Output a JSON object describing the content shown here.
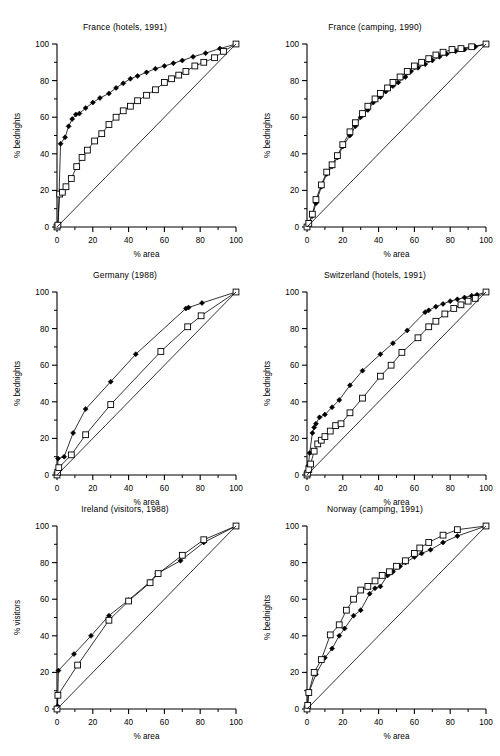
{
  "figure": {
    "columns": 2,
    "rows": 3,
    "background": "#ffffff",
    "line_color": "#000000"
  },
  "axis_common": {
    "xlabel": "% area",
    "ylabel_bednights": "% bednights",
    "ylabel_visitors": "% visitors",
    "xlim": [
      0,
      100
    ],
    "ylim": [
      0,
      100
    ],
    "xticks": [
      0,
      20,
      40,
      60,
      80,
      100
    ],
    "yticks": [
      0,
      20,
      40,
      60,
      80,
      100
    ],
    "xtick_labels": [
      "0",
      "20",
      "40",
      "60",
      "80",
      "100"
    ],
    "ytick_labels": [
      "0",
      "20",
      "40",
      "60",
      "80",
      "100"
    ],
    "minor_xticks": [
      10,
      30,
      50,
      70,
      90
    ],
    "minor_yticks": [
      10,
      30,
      50,
      70,
      90
    ],
    "grid": false,
    "legend": "none",
    "series_names": [
      "filled-diamond-series",
      "open-square-series",
      "equality-line"
    ],
    "marker_filled": "filled diamond",
    "marker_open": "open square"
  },
  "chart_data": [
    {
      "type": "line",
      "panel": "france-hotels",
      "title": "France (hotels, 1991)",
      "xlabel": "% area",
      "ylabel": "% bednights",
      "xlim": [
        0,
        100
      ],
      "ylim": [
        0,
        100
      ],
      "grid": false,
      "series": [
        {
          "name": "filled-diamond-series",
          "marker": "filled-diamond",
          "x": [
            0,
            0.6,
            2,
            4.5,
            6.5,
            8.5,
            10.5,
            12.5,
            16,
            20,
            24,
            29,
            33,
            37,
            41,
            45,
            50,
            55,
            60,
            65,
            70,
            76,
            83,
            91,
            100
          ],
          "y": [
            0,
            1,
            45.5,
            49,
            55,
            59,
            61.5,
            62,
            65,
            68,
            70.5,
            73,
            76,
            78.5,
            81,
            82.5,
            84.5,
            86.5,
            88,
            89.5,
            91,
            93,
            95,
            97.5,
            100
          ]
        },
        {
          "name": "open-square-series",
          "marker": "open-square",
          "x": [
            0,
            0.5,
            1.5,
            3,
            5,
            8,
            11,
            14,
            17,
            21,
            25,
            29,
            33,
            37,
            41,
            45,
            50,
            55,
            60,
            64,
            68,
            72,
            77,
            82,
            88,
            93,
            100
          ],
          "y": [
            0,
            1,
            18,
            19,
            22,
            26.5,
            33,
            38,
            42,
            47,
            51,
            56,
            60,
            63.5,
            66,
            69,
            72,
            75,
            79,
            81,
            83,
            85,
            88,
            90,
            92.5,
            96,
            100
          ]
        },
        {
          "name": "equality-line",
          "marker": "none",
          "x": [
            0,
            100
          ],
          "y": [
            0,
            100
          ]
        }
      ]
    },
    {
      "type": "line",
      "panel": "france-camping",
      "title": "France (camping, 1990)",
      "xlabel": "% area",
      "ylabel": "% bednights",
      "xlim": [
        0,
        100
      ],
      "ylim": [
        0,
        100
      ],
      "grid": false,
      "series": [
        {
          "name": "filled-diamond-series",
          "marker": "filled-diamond",
          "x": [
            0,
            1,
            3,
            5,
            8,
            11,
            14,
            17,
            20,
            24,
            27,
            30,
            34,
            37,
            41,
            44,
            48,
            51,
            55,
            58,
            62,
            66,
            70,
            74,
            78,
            83,
            88,
            94,
            100
          ],
          "y": [
            0,
            2,
            6,
            13,
            22,
            29,
            33,
            38,
            44,
            50,
            55,
            60,
            64,
            68,
            71,
            74,
            77,
            79,
            82,
            85,
            87,
            89,
            91,
            93,
            94.5,
            96,
            97,
            98.5,
            100
          ]
        },
        {
          "name": "open-square-series",
          "marker": "open-square",
          "x": [
            0,
            1,
            3,
            5,
            8,
            11,
            14,
            17,
            20,
            24,
            27,
            31,
            34,
            38,
            41,
            45,
            48,
            52,
            56,
            60,
            64,
            68,
            72,
            76,
            81,
            86,
            92,
            100
          ],
          "y": [
            0,
            2,
            7,
            15,
            23,
            30,
            34,
            39,
            45,
            52,
            57,
            62,
            66,
            70,
            73,
            76,
            79,
            82,
            85,
            88,
            90,
            92,
            94,
            95.5,
            97,
            97.5,
            98.5,
            100
          ]
        },
        {
          "name": "equality-line",
          "marker": "none",
          "x": [
            0,
            100
          ],
          "y": [
            0,
            100
          ]
        }
      ]
    },
    {
      "type": "line",
      "panel": "germany",
      "title": "Germany (1988)",
      "xlabel": "% area",
      "ylabel": "% bednights",
      "xlim": [
        0,
        100
      ],
      "ylim": [
        0,
        100
      ],
      "grid": false,
      "series": [
        {
          "name": "filled-diamond-series",
          "marker": "filled-diamond",
          "x": [
            0,
            0.3,
            0.6,
            4,
            9,
            16,
            30,
            44,
            72,
            73.5,
            81,
            100
          ],
          "y": [
            0,
            2,
            9,
            10,
            23,
            36,
            51,
            66,
            91,
            91.5,
            94,
            100
          ]
        },
        {
          "name": "open-square-series",
          "marker": "open-square",
          "x": [
            0,
            0.4,
            1,
            8,
            16,
            30,
            58,
            73,
            80.5,
            100
          ],
          "y": [
            0,
            1.5,
            4,
            11,
            22,
            38.5,
            67.5,
            81,
            87,
            100
          ]
        },
        {
          "name": "equality-line",
          "marker": "none",
          "x": [
            0,
            100
          ],
          "y": [
            0,
            100
          ]
        }
      ]
    },
    {
      "type": "line",
      "panel": "switzerland-hotels",
      "title": "Switzerland (hotels, 1991)",
      "xlabel": "% area",
      "ylabel": "% bednights",
      "xlim": [
        0,
        100
      ],
      "ylim": [
        0,
        100
      ],
      "grid": false,
      "series": [
        {
          "name": "filled-diamond-series",
          "marker": "filled-diamond",
          "x": [
            0,
            0.3,
            0.7,
            1.5,
            3,
            4,
            5,
            7,
            10,
            14,
            18,
            24,
            31,
            41,
            48,
            56,
            66,
            68,
            72,
            76,
            80,
            84,
            88,
            92,
            95,
            100
          ],
          "y": [
            0,
            2,
            5,
            12,
            23,
            26,
            28,
            31.5,
            33,
            37,
            41,
            49,
            57,
            66,
            72,
            79,
            89,
            90,
            92,
            93.5,
            95,
            96,
            97,
            98,
            98.5,
            100
          ]
        },
        {
          "name": "open-square-series",
          "marker": "open-square",
          "x": [
            0,
            0.4,
            1,
            2,
            4,
            6,
            8,
            10,
            13,
            16,
            19,
            24,
            31,
            41,
            47,
            53,
            62,
            68,
            72,
            77,
            82,
            86,
            90,
            94,
            100
          ],
          "y": [
            0,
            1,
            3,
            6,
            13,
            17,
            19,
            21,
            24,
            27,
            28,
            34,
            42,
            54,
            60,
            67,
            75,
            81,
            84,
            88,
            91,
            93,
            95,
            96.5,
            100
          ]
        },
        {
          "name": "equality-line",
          "marker": "none",
          "x": [
            0,
            100
          ],
          "y": [
            0,
            100
          ]
        }
      ]
    },
    {
      "type": "line",
      "panel": "ireland-visitors",
      "title": "Ireland (visitors, 1988)",
      "xlabel": "% area",
      "ylabel": "% visitors",
      "xlim": [
        0,
        100
      ],
      "ylim": [
        0,
        100
      ],
      "grid": false,
      "series": [
        {
          "name": "filled-diamond-series",
          "marker": "filled-diamond",
          "x": [
            0,
            0.3,
            0.8,
            9.5,
            19,
            29,
            40,
            52,
            56,
            69,
            82,
            100
          ],
          "y": [
            0,
            1.5,
            21,
            30,
            40,
            51,
            59.5,
            69.5,
            74,
            81,
            91,
            100
          ]
        },
        {
          "name": "open-square-series",
          "marker": "open-square",
          "x": [
            0,
            0.5,
            11.5,
            29,
            40,
            52,
            56.5,
            70,
            82,
            100
          ],
          "y": [
            0,
            7.5,
            24,
            48.5,
            59,
            69,
            74,
            84,
            92.5,
            100
          ]
        },
        {
          "name": "equality-line",
          "marker": "none",
          "x": [
            0,
            100
          ],
          "y": [
            0,
            100
          ]
        }
      ]
    },
    {
      "type": "line",
      "panel": "norway-camping",
      "title": "Norway (camping, 1991)",
      "xlabel": "% area",
      "ylabel": "% bednights",
      "xlim": [
        0,
        100
      ],
      "ylim": [
        0,
        100
      ],
      "grid": false,
      "series": [
        {
          "name": "filled-diamond-series",
          "marker": "filled-diamond",
          "x": [
            0,
            0.3,
            0.8,
            5,
            10,
            14,
            18,
            21,
            26,
            30,
            35,
            38,
            41,
            45,
            48,
            52,
            55,
            60,
            64,
            69,
            76,
            84,
            100
          ],
          "y": [
            0,
            2,
            8.5,
            19,
            28,
            33,
            40,
            44,
            51,
            54,
            63,
            66,
            67,
            73,
            75,
            78,
            80,
            83,
            85,
            87,
            91,
            94.5,
            100
          ]
        },
        {
          "name": "open-square-series",
          "marker": "open-square",
          "x": [
            0,
            0.4,
            1,
            4,
            8,
            13,
            18,
            22,
            26,
            30,
            34,
            38,
            42,
            46,
            50,
            55,
            60,
            63,
            68,
            76,
            84,
            100
          ],
          "y": [
            0,
            2,
            9,
            20,
            27,
            40.5,
            46,
            54,
            60,
            65,
            67,
            70,
            73,
            75,
            78,
            81,
            85,
            88,
            91,
            95,
            98,
            100
          ]
        },
        {
          "name": "equality-line",
          "marker": "none",
          "x": [
            0,
            100
          ],
          "y": [
            0,
            100
          ]
        }
      ]
    }
  ]
}
